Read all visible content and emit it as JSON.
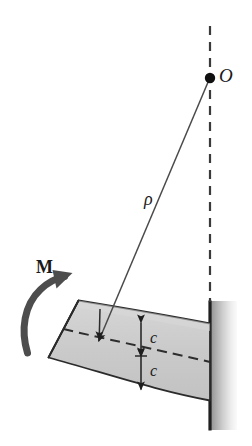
{
  "figure": {
    "background_color": "#ffffff",
    "width": 252,
    "height": 446
  },
  "labels": {
    "center_of_curvature": "O",
    "radius_of_curvature": "ρ",
    "moment": "M",
    "distance_top": "c",
    "distance_bottom": "c"
  },
  "colors": {
    "ink": "#1a1a1a",
    "outline": "#2b2b2b",
    "beam_fill": "#c9c9c9",
    "beam_fill_light": "#d4d4d4",
    "wall_edge": "#1f1f1f",
    "wall_gradient_start": "#9a9a9a",
    "wall_gradient_end": "#f2f2f2",
    "dashed_line": "#3a3a3a",
    "arrow_moment": "#4a4a4a"
  },
  "geometry": {
    "center_point": {
      "x": 210,
      "y": 78,
      "dot_radius": 5
    },
    "axis_dashed_vertical": {
      "x": 210,
      "y_top": 26,
      "y_bottom": 302,
      "dash": "9 7",
      "width": 2.2
    },
    "radius_line": {
      "x1": 208,
      "y1": 80,
      "x2": 98,
      "y2": 342
    },
    "neutral_axis_dashed": {
      "dash": "9 6",
      "width": 2.0
    },
    "dimension_line_x": 141,
    "dimension_top_y": 322,
    "dimension_mid_y": 356,
    "dimension_bottom_y": 390,
    "wall": {
      "x_edge": 209,
      "width": 26,
      "y_top": 301,
      "y_bottom": 430
    }
  },
  "elements": {
    "beam_name": "curved-beam",
    "wall_name": "fixed-wall-support",
    "neutral_axis_name": "neutral-axis",
    "moment_arrow_name": "moment-arrow",
    "radius_arrow_name": "radius-arrow"
  }
}
